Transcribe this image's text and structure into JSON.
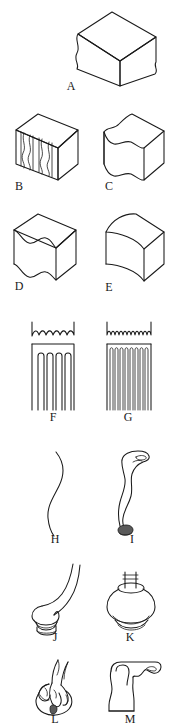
{
  "figure": {
    "background_color": "#ffffff",
    "ink_color": "#1a1a1a",
    "width_px": 176,
    "height_px": 728,
    "panel_count": 13
  },
  "panels": [
    {
      "id": "A",
      "label": "A",
      "icon_name": "wavy-profile-block-single",
      "description": "Isometric rectangular block with one shallow wavy vertical edge profile",
      "row": 1,
      "column": "center",
      "label_x": 63,
      "label_y": 86
    },
    {
      "id": "B",
      "label": "B",
      "icon_name": "multi-groove-block",
      "description": "Isometric block with multiple vertical grooves cut in the front face",
      "row": 2,
      "column": "left",
      "label_x": 13,
      "label_y": 186
    },
    {
      "id": "C",
      "label": "C",
      "icon_name": "s-curve-block",
      "description": "Isometric block with an S-curve wave across the top front edge",
      "row": 2,
      "column": "right",
      "label_x": 103,
      "label_y": 186
    },
    {
      "id": "D",
      "label": "D",
      "icon_name": "double-wave-block",
      "description": "Isometric block with a deep double-wave profile on the left face",
      "row": 3,
      "column": "left",
      "label_x": 13,
      "label_y": 286
    },
    {
      "id": "E",
      "label": "E",
      "icon_name": "concave-arc-block",
      "description": "Isometric block with a single large concave arc face",
      "row": 3,
      "column": "right",
      "label_x": 103,
      "label_y": 286
    },
    {
      "id": "F",
      "label": "F",
      "icon_name": "coarse-comb",
      "description": "Comb with coarse wavy edge profile above and four wide slots below",
      "slot_count": 4,
      "tine_count": 5,
      "row": 4,
      "column": "left",
      "label_x": 53,
      "label_y": 416
    },
    {
      "id": "G",
      "label": "G",
      "icon_name": "fine-comb",
      "description": "Comb with fine wavy edge profile above and many narrow slots below",
      "slot_count": 9,
      "tine_count": 10,
      "row": 4,
      "column": "right",
      "label_x": 128,
      "label_y": 416
    },
    {
      "id": "H",
      "label": "H",
      "icon_name": "s-curve-line",
      "description": "Single slender S-curve outline (cyma profile line)",
      "row": 5,
      "column": "left",
      "label_x": 55,
      "label_y": 536
    },
    {
      "id": "I",
      "label": "I",
      "icon_name": "cabriole-leg",
      "description": "Tall cabriole furniture leg with knee, ankle and pad foot",
      "row": 5,
      "column": "right",
      "label_x": 128,
      "label_y": 536
    },
    {
      "id": "J",
      "label": "J",
      "icon_name": "curved-leg-with-pad-foot",
      "description": "Short curved leg terminating in a wide flattened pad foot",
      "row": 6,
      "column": "left",
      "label_x": 55,
      "label_y": 637
    },
    {
      "id": "K",
      "label": "K",
      "icon_name": "bulbous-turned-finial",
      "description": "Bulbous turned knob or finial with small cylindrical neck",
      "row": 6,
      "column": "right",
      "label_x": 128,
      "label_y": 637
    },
    {
      "id": "L",
      "label": "L",
      "icon_name": "ball-and-claw-foot",
      "description": "Ball-and-claw foot with talons gripping a sphere",
      "row": 7,
      "column": "left",
      "label_x": 55,
      "label_y": 714
    },
    {
      "id": "M",
      "label": "M",
      "icon_name": "scroll-bracket-foot",
      "description": "Scrolled bracket foot profile with ogee curve",
      "row": 7,
      "column": "right",
      "label_x": 128,
      "label_y": 714
    }
  ]
}
